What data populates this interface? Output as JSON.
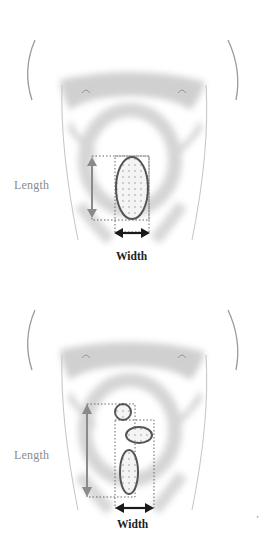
{
  "figure": {
    "panels": [
      {
        "id": "single-lesion",
        "length_label": "Length",
        "width_label": "Width",
        "lesion_count": 1
      },
      {
        "id": "multiple-lesions",
        "length_label": "Length",
        "width_label": "Width",
        "lesion_count": 3
      }
    ],
    "corner_mark": "ʼ",
    "colors": {
      "body_shading": "#b8b8b8",
      "outline": "#9a9a9a",
      "lesion_outline": "#555555",
      "length_arrow": "#8a8a8a",
      "width_arrow": "#1a1a1a",
      "dotted_box": "#666666"
    }
  }
}
